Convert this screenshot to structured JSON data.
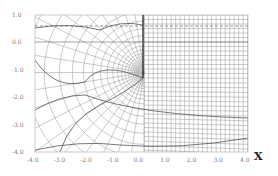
{
  "chart_data": {
    "type": "line",
    "title": "",
    "xlabel": "X",
    "ylabel": "",
    "xlim": [
      -4.0,
      4.0
    ],
    "ylim": [
      -4.0,
      1.0
    ],
    "x_ticks": [
      "-4.0",
      "-3.0",
      "-2.0",
      "-1.0",
      "0.0",
      "1.0",
      "2.0",
      "3.0",
      "4.0"
    ],
    "y_ticks": [
      "1.0",
      "0.0",
      "-1.0",
      "-2.0",
      "-3.0",
      "-4.0"
    ],
    "features": {
      "cut_line": {
        "x": 0.1,
        "y_from": 1.0,
        "y_to": -1.1
      },
      "dashed_line_y": 0.4,
      "axis_line_y": 0.0
    }
  },
  "labels": {
    "x_axis": "X"
  }
}
